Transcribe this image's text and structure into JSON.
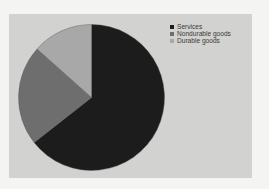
{
  "chart_data": {
    "type": "pie",
    "title": "",
    "categories": [
      "Services",
      "Nondurable goods",
      "Durable goods"
    ],
    "values": [
      64.4,
      22.2,
      13.4
    ],
    "colors": [
      "#1c1c1c",
      "#6e6e6e",
      "#a8a8a8"
    ],
    "start_angle_deg": 0,
    "direction": "clockwise",
    "legend_position": "upper-right"
  },
  "legend": {
    "items": [
      {
        "label": "Services",
        "color": "#1c1c1c"
      },
      {
        "label": "Nondurable goods",
        "color": "#6e6e6e"
      },
      {
        "label": "Durable goods",
        "color": "#a8a8a8"
      }
    ]
  },
  "colors": {
    "background": "#f4f4f2",
    "panel": "#d2d2d0"
  }
}
